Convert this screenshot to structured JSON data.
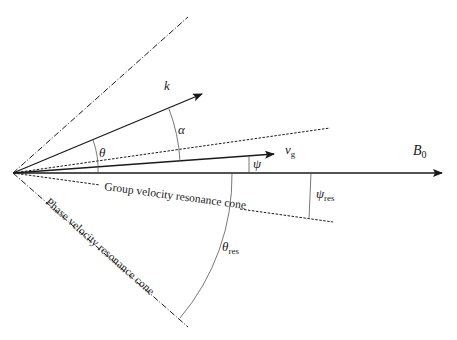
{
  "diagram": {
    "vectors": {
      "k": {
        "label": "k"
      },
      "vg": {
        "label": "v",
        "subscript": "g"
      },
      "B0": {
        "label": "B",
        "subscript": "0"
      }
    },
    "angles": {
      "theta": {
        "label": "θ"
      },
      "alpha": {
        "label": "α"
      },
      "psi": {
        "label": "ψ"
      },
      "psi_res": {
        "label": "ψ",
        "subscript": "res"
      },
      "theta_res": {
        "label": "θ",
        "subscript": "res"
      }
    },
    "cones": {
      "group": {
        "label": "Group velocity resonance cone"
      },
      "phase": {
        "label": "Phase velocity resonance cone"
      }
    },
    "colors": {
      "line": "#1a1a1a",
      "arc": "#555555",
      "background": "#ffffff"
    }
  }
}
